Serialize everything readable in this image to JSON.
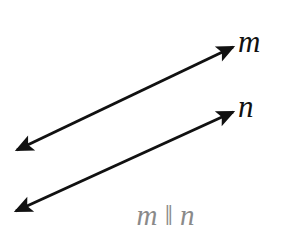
{
  "figure": {
    "kind": "geometry-diagram",
    "background_color": "#ffffff",
    "stroke_color": "#111111",
    "caption_color": "#8a8a8a",
    "width": 289,
    "height": 247,
    "labels": {
      "line_m": "m",
      "line_n": "n",
      "caption": "m ‖ n"
    },
    "lines": [
      {
        "name": "line-m",
        "label": "m",
        "x1": 17,
        "y1": 150,
        "x2": 233,
        "y2": 47,
        "arrowheads": "both",
        "stroke_width": 3,
        "color": "#111111"
      },
      {
        "name": "line-n",
        "label": "n",
        "x1": 16,
        "y1": 211,
        "x2": 233,
        "y2": 112,
        "arrowheads": "both",
        "stroke_width": 3,
        "color": "#111111"
      }
    ]
  }
}
